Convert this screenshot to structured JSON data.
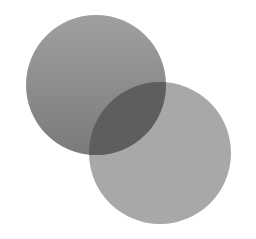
{
  "diagram": {
    "type": "venn",
    "shapes": [
      {
        "id": "circle-a",
        "cx": 96,
        "cy": 85,
        "r": 70,
        "color_top": "#a0a0a0",
        "color_bottom": "#7a7a7a"
      },
      {
        "id": "circle-b",
        "cx": 160,
        "cy": 153,
        "r": 71,
        "color": "#a8a8a8"
      }
    ],
    "overlap_color": "#5e5e5e"
  }
}
